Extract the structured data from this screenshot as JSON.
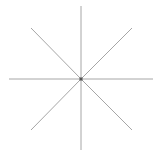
{
  "figure": {
    "type": "asterisk-star",
    "ray_count": 8,
    "center": [
      81,
      79
    ],
    "colors": {
      "ray": "#a6a6a6",
      "center_dot": "#555555",
      "background": "#ffffff"
    },
    "rays": [
      {
        "name": "north",
        "x2": 81,
        "y2": 6
      },
      {
        "name": "south",
        "x2": 81,
        "y2": 150
      },
      {
        "name": "west",
        "x2": 9,
        "y2": 79
      },
      {
        "name": "east",
        "x2": 153,
        "y2": 79
      },
      {
        "name": "north-west",
        "x2": 31,
        "y2": 28
      },
      {
        "name": "north-east",
        "x2": 132,
        "y2": 28
      },
      {
        "name": "south-west",
        "x2": 31,
        "y2": 130
      },
      {
        "name": "south-east",
        "x2": 132,
        "y2": 130
      }
    ]
  }
}
